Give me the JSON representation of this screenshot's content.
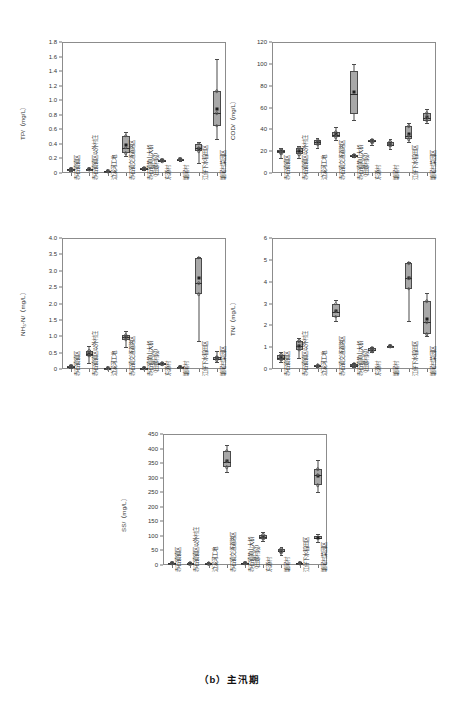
{
  "caption": "（b）主汛期",
  "categories": [
    {
      "line1": "赤石镇镇区",
      "line2": ""
    },
    {
      "line1": "赤石镇镇区以外村庄",
      "line2": ""
    },
    {
      "line1": "边溪河工地",
      "line2": ""
    },
    {
      "line1": "赤石镇交通道路区",
      "line2": ""
    },
    {
      "line1": "赤石镇黄山大桥",
      "line2": "（田螺村段）"
    },
    {
      "line1": "东源村",
      "line2": ""
    },
    {
      "line1": "塘尾村",
      "line2": ""
    },
    {
      "line1": "江仔下水稻田区",
      "line2": ""
    },
    {
      "line1": "塘尾村菜园区",
      "line2": ""
    }
  ],
  "chart_data": [
    {
      "type": "box",
      "id": "tp",
      "title": "",
      "ylabel": "TP/（mg/L）",
      "xlabel": "",
      "ylim": [
        0,
        1.8
      ],
      "yticks": [
        0,
        0.2,
        0.4,
        0.6,
        0.8,
        1.0,
        1.2,
        1.4,
        1.6,
        1.8
      ],
      "ytick_labels": [
        "0",
        "0.2",
        "0.4",
        "0.6",
        "0.8",
        "1.0",
        "1.2",
        "1.4",
        "1.6",
        "1.8"
      ],
      "grid": false,
      "boxes": [
        {
          "category": "赤石镇镇区",
          "min": 0.03,
          "q1": 0.04,
          "median": 0.05,
          "q3": 0.06,
          "max": 0.07,
          "mean": 0.05
        },
        {
          "category": "赤石镇镇区以外村庄",
          "min": 0.04,
          "q1": 0.045,
          "median": 0.05,
          "q3": 0.055,
          "max": 0.06,
          "mean": 0.05
        },
        {
          "category": "边溪河工地",
          "min": 0.015,
          "q1": 0.02,
          "median": 0.025,
          "q3": 0.03,
          "max": 0.035,
          "mean": 0.025
        },
        {
          "category": "赤石镇交通道路区",
          "min": 0.24,
          "q1": 0.27,
          "median": 0.35,
          "q3": 0.51,
          "max": 0.56,
          "mean": 0.39
        },
        {
          "category": "赤石镇黄山大桥（田螺村段）",
          "min": 0.04,
          "q1": 0.05,
          "median": 0.06,
          "q3": 0.07,
          "max": 0.08,
          "mean": 0.06
        },
        {
          "category": "东源村",
          "min": 0.16,
          "q1": 0.165,
          "median": 0.17,
          "q3": 0.18,
          "max": 0.19,
          "mean": 0.172
        },
        {
          "category": "塘尾村",
          "min": 0.17,
          "q1": 0.18,
          "median": 0.185,
          "q3": 0.195,
          "max": 0.205,
          "mean": 0.187
        },
        {
          "category": "江仔下水稻田区",
          "min": 0.14,
          "q1": 0.3,
          "median": 0.35,
          "q3": 0.4,
          "max": 0.42,
          "mean": 0.33
        },
        {
          "category": "塘尾村菜园区",
          "min": 0.47,
          "q1": 0.65,
          "median": 0.82,
          "q3": 1.12,
          "max": 1.57,
          "mean": 0.88
        }
      ]
    },
    {
      "type": "box",
      "id": "cod",
      "title": "",
      "ylabel": "COD/（mg/L）",
      "xlabel": "",
      "ylim": [
        0,
        120
      ],
      "yticks": [
        0,
        20,
        40,
        60,
        80,
        100,
        120
      ],
      "ytick_labels": [
        "0",
        "20",
        "40",
        "60",
        "80",
        "100",
        "120"
      ],
      "grid": false,
      "boxes": [
        {
          "category": "赤石镇镇区",
          "min": 14,
          "q1": 18,
          "median": 20,
          "q3": 21,
          "max": 23,
          "mean": 19.5
        },
        {
          "category": "赤石镇镇区以外村庄",
          "min": 14,
          "q1": 17,
          "median": 20,
          "q3": 23,
          "max": 25,
          "mean": 20
        },
        {
          "category": "边溪河工地",
          "min": 23,
          "q1": 26,
          "median": 28,
          "q3": 30,
          "max": 32,
          "mean": 28
        },
        {
          "category": "赤石镇交通道路区",
          "min": 30,
          "q1": 33,
          "median": 35,
          "q3": 38,
          "max": 42,
          "mean": 35.5
        },
        {
          "category": "赤石镇黄山大桥（田螺村段）",
          "min": 15,
          "q1": 15.5,
          "median": 16,
          "q3": 16.5,
          "max": 17,
          "mean": 16
        },
        {
          "category": "东源村",
          "min": 26,
          "q1": 28,
          "median": 29,
          "q3": 30,
          "max": 31,
          "mean": 29
        },
        {
          "category": "塘尾村",
          "min": 22,
          "q1": 25,
          "median": 26,
          "q3": 28,
          "max": 31,
          "mean": 26.5
        },
        {
          "category": "江仔下水稻田区",
          "min": 28,
          "q1": 31,
          "median": 34,
          "q3": 43,
          "max": 46,
          "mean": 36
        },
        {
          "category": "塘尾村菜园区",
          "min": 46,
          "q1": 48,
          "median": 50,
          "q3": 55,
          "max": 59,
          "mean": 51
        }
      ],
      "special_box": {
        "category": "赤石镇黄山大桥（田螺村段）",
        "note": "tall box at x5 region",
        "min": 49,
        "q1": 54,
        "median": 72,
        "q3": 93,
        "max": 100,
        "mean": 74
      }
    },
    {
      "type": "box",
      "id": "nh3n",
      "title": "",
      "ylabel": "NH₃-N/（mg/L）",
      "xlabel": "",
      "ylim": [
        0,
        4.0
      ],
      "yticks": [
        0,
        0.5,
        1.0,
        1.5,
        2.0,
        2.5,
        3.0,
        3.5,
        4.0
      ],
      "ytick_labels": [
        "0",
        "0.5",
        "1.0",
        "1.5",
        "2.0",
        "2.5",
        "3.0",
        "3.5",
        "4.0"
      ],
      "grid": false,
      "boxes": [
        {
          "category": "赤石镇镇区",
          "min": 0.03,
          "q1": 0.05,
          "median": 0.07,
          "q3": 0.1,
          "max": 0.13,
          "mean": 0.08
        },
        {
          "category": "赤石镇镇区以外村庄",
          "min": 0.18,
          "q1": 0.4,
          "median": 0.47,
          "q3": 0.55,
          "max": 0.7,
          "mean": 0.46
        },
        {
          "category": "边溪河工地",
          "min": 0.01,
          "q1": 0.015,
          "median": 0.02,
          "q3": 0.025,
          "max": 0.03,
          "mean": 0.02
        },
        {
          "category": "赤石镇交通道路区",
          "min": 0.66,
          "q1": 0.9,
          "median": 0.97,
          "q3": 1.04,
          "max": 1.15,
          "mean": 0.97
        },
        {
          "category": "赤石镇黄山大桥（田螺村段）",
          "min": 0.01,
          "q1": 0.015,
          "median": 0.02,
          "q3": 0.025,
          "max": 0.03,
          "mean": 0.02
        },
        {
          "category": "东源村",
          "min": 0.14,
          "q1": 0.15,
          "median": 0.16,
          "q3": 0.17,
          "max": 0.18,
          "mean": 0.16
        },
        {
          "category": "塘尾村",
          "min": 0.04,
          "q1": 0.05,
          "median": 0.06,
          "q3": 0.07,
          "max": 0.08,
          "mean": 0.06
        },
        {
          "category": "江仔下水稻田区",
          "min": 0.84,
          "q1": 2.28,
          "median": 2.62,
          "q3": 3.4,
          "max": 3.42,
          "mean": 2.78
        },
        {
          "category": "塘尾村菜园区",
          "min": 0.2,
          "q1": 0.27,
          "median": 0.32,
          "q3": 0.38,
          "max": 0.55,
          "mean": 0.33
        }
      ]
    },
    {
      "type": "box",
      "id": "tn",
      "title": "",
      "ylabel": "TN/（mg/L）",
      "xlabel": "",
      "ylim": [
        0,
        6
      ],
      "yticks": [
        0,
        1,
        2,
        3,
        4,
        5,
        6
      ],
      "ytick_labels": [
        "0",
        "1",
        "2",
        "3",
        "4",
        "5",
        "6"
      ],
      "grid": false,
      "boxes": [
        {
          "category": "赤石镇镇区",
          "min": 0.3,
          "q1": 0.42,
          "median": 0.5,
          "q3": 0.66,
          "max": 0.8,
          "mean": 0.54
        },
        {
          "category": "赤石镇镇区以外村庄",
          "min": 0.52,
          "q1": 0.88,
          "median": 1.05,
          "q3": 1.28,
          "max": 1.42,
          "mean": 1.05
        },
        {
          "category": "边溪河工地",
          "min": 0.1,
          "q1": 0.12,
          "median": 0.14,
          "q3": 0.17,
          "max": 0.2,
          "mean": 0.14
        },
        {
          "category": "赤石镇交通道路区",
          "min": 2.22,
          "q1": 2.4,
          "median": 2.62,
          "q3": 3.0,
          "max": 3.18,
          "mean": 2.65
        },
        {
          "category": "赤石镇黄山大桥（田螺村段）",
          "min": 0.1,
          "q1": 0.13,
          "median": 0.16,
          "q3": 0.22,
          "max": 0.26,
          "mean": 0.17
        },
        {
          "category": "东源村",
          "min": 0.76,
          "q1": 0.82,
          "median": 0.86,
          "q3": 0.94,
          "max": 1.0,
          "mean": 0.87
        },
        {
          "category": "塘尾村",
          "min": 1.0,
          "q1": 1.02,
          "median": 1.04,
          "q3": 1.07,
          "max": 1.1,
          "mean": 1.05
        },
        {
          "category": "江仔下水稻田区",
          "min": 2.22,
          "q1": 3.68,
          "median": 4.15,
          "q3": 4.85,
          "max": 4.88,
          "mean": 4.15
        },
        {
          "category": "塘尾村菜园区",
          "min": 1.5,
          "q1": 1.6,
          "median": 2.15,
          "q3": 3.1,
          "max": 3.5,
          "mean": 2.3
        }
      ]
    },
    {
      "type": "box",
      "id": "ss",
      "title": "",
      "ylabel": "SS/（mg/L）",
      "xlabel": "",
      "ylim": [
        0,
        450
      ],
      "yticks": [
        0,
        50,
        100,
        150,
        200,
        250,
        300,
        350,
        400,
        450
      ],
      "ytick_labels": [
        "0",
        "50",
        "100",
        "150",
        "200",
        "250",
        "300",
        "350",
        "400",
        "450"
      ],
      "grid": false,
      "boxes": [
        {
          "category": "赤石镇镇区",
          "min": 3,
          "q1": 5,
          "median": 6,
          "q3": 8,
          "max": 10,
          "mean": 6
        },
        {
          "category": "赤石镇镇区以外村庄",
          "min": 3,
          "q1": 4,
          "median": 5,
          "q3": 7,
          "max": 9,
          "mean": 5
        },
        {
          "category": "边溪河工地",
          "min": 3,
          "q1": 4,
          "median": 5,
          "q3": 7,
          "max": 9,
          "mean": 5
        },
        {
          "category": "赤石镇交通道路区",
          "min": 320,
          "q1": 335,
          "median": 355,
          "q3": 392,
          "max": 412,
          "mean": 358
        },
        {
          "category": "赤石镇黄山大桥（田螺村段）",
          "min": 3,
          "q1": 5,
          "median": 6,
          "q3": 8,
          "max": 10,
          "mean": 6
        },
        {
          "category": "东源村",
          "min": 82,
          "q1": 90,
          "median": 96,
          "q3": 104,
          "max": 112,
          "mean": 96
        },
        {
          "category": "塘尾村",
          "min": 35,
          "q1": 44,
          "median": 48,
          "q3": 55,
          "max": 62,
          "mean": 48
        },
        {
          "category": "江仔下水稻田区",
          "min": 3,
          "q1": 5,
          "median": 6,
          "q3": 8,
          "max": 10,
          "mean": 6
        },
        {
          "category": "塘尾村菜园区",
          "min": 250,
          "q1": 275,
          "median": 310,
          "q3": 330,
          "max": 360,
          "mean": 305
        }
      ],
      "extra_box": {
        "category": "塘尾村菜园区",
        "min": 80,
        "q1": 88,
        "median": 92,
        "q3": 98,
        "max": 105,
        "mean": 92
      }
    }
  ],
  "style": {
    "box_fill": "#a8a8a8",
    "box_edge": "#4a4a4a",
    "mean_marker": "#1f1f1f",
    "axis_color": "#8c8c8c",
    "text_color": "#2b2b2b"
  }
}
